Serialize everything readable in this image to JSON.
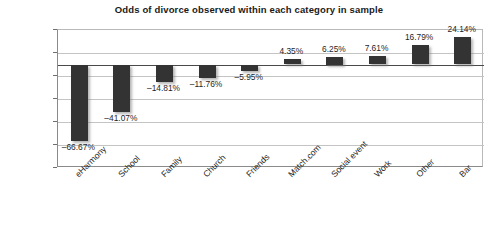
{
  "chart_data": {
    "type": "bar",
    "title": "Odds of divorce observed within each category in sample",
    "xlabel": "",
    "ylabel": "",
    "ylim": [
      -90,
      30
    ],
    "grid": true,
    "legend": "none",
    "orientation": "vertical",
    "bar_color": "#333333",
    "background_color": "#ffffff",
    "gridline_color": "#c4c4c4",
    "axis_color": "#8a8a8a",
    "value_unit": "percent",
    "categories": [
      "eHarmony",
      "School",
      "Family",
      "Church",
      "Friends",
      "Match.com",
      "Social event",
      "Work",
      "Other",
      "Bar"
    ],
    "values": [
      -66.67,
      -41.07,
      -14.81,
      -11.76,
      -5.95,
      4.35,
      6.25,
      7.61,
      16.79,
      24.14
    ],
    "data_labels": [
      "–66.67%",
      "–41.07%",
      "–14.81%",
      "–11.76%",
      "–5.95%",
      "4.35%",
      "6.25%",
      "7.61%",
      "16.79%",
      "24.14%"
    ],
    "ytick_values": [
      30,
      10,
      -10,
      -30,
      -50,
      -70,
      -90
    ],
    "ytick_labels": [
      "30%",
      "10%",
      "–10%",
      "–30%",
      "–50%",
      "–70%",
      "–90%"
    ]
  }
}
